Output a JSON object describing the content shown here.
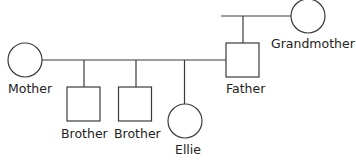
{
  "diagram": {
    "type": "family-tree",
    "nodes": [
      {
        "id": "mother",
        "label": "Mother",
        "sex": "female"
      },
      {
        "id": "brother1",
        "label": "Brother",
        "sex": "male"
      },
      {
        "id": "brother2",
        "label": "Brother",
        "sex": "male"
      },
      {
        "id": "ellie",
        "label": "Ellie",
        "sex": "female"
      },
      {
        "id": "father",
        "label": "Father",
        "sex": "male"
      },
      {
        "id": "grandmother",
        "label": "Grandmother",
        "sex": "female"
      }
    ],
    "relations": [
      {
        "type": "couple",
        "members": [
          "mother",
          "father"
        ],
        "children": [
          "brother1",
          "brother2",
          "ellie"
        ]
      },
      {
        "type": "parent",
        "parent": "grandmother",
        "children": [
          "father"
        ]
      }
    ]
  }
}
